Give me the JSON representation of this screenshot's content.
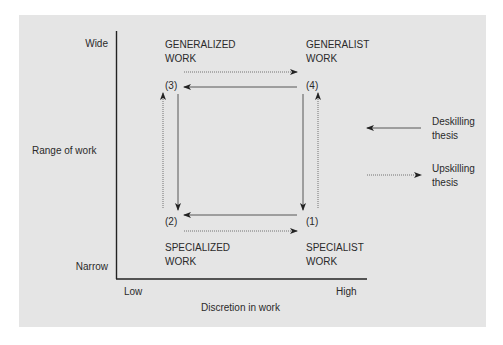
{
  "diagram": {
    "y_axis": {
      "label": "Range of work",
      "top_label": "Wide",
      "bottom_label": "Narrow"
    },
    "x_axis": {
      "label": "Discretion in work",
      "left_label": "Low",
      "right_label": "High"
    },
    "quadrants": {
      "top_left": {
        "title_line1": "GENERALIZED",
        "title_line2": "WORK",
        "number": "(3)"
      },
      "top_right": {
        "title_line1": "GENERALIST",
        "title_line2": "WORK",
        "number": "(4)"
      },
      "bottom_left": {
        "title_line1": "SPECIALIZED",
        "title_line2": "WORK",
        "number": "(2)"
      },
      "bottom_right": {
        "title_line1": "SPECIALIST",
        "title_line2": "WORK",
        "number": "(1)"
      }
    },
    "legend": [
      {
        "line1": "Deskilling",
        "line2": "thesis",
        "style": "solid",
        "direction": "left"
      },
      {
        "line1": "Upskilling",
        "line2": "thesis",
        "style": "dotted",
        "direction": "right"
      }
    ],
    "colors": {
      "panel": "#e5e5e5",
      "line": "#222222",
      "background": "#ffffff"
    }
  }
}
